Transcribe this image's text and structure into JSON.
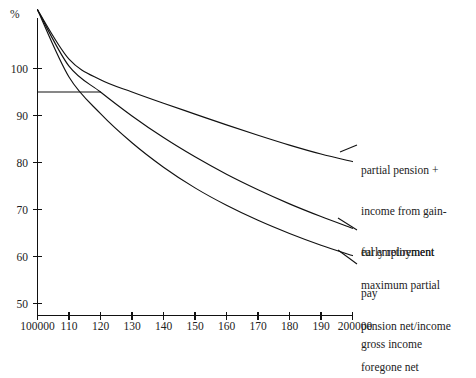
{
  "chart_data": {
    "type": "line",
    "title": "",
    "xlabel": "gross income",
    "ylabel": "%",
    "grid": false,
    "legend_position": "right-inline-annotations",
    "xlim": [
      100000,
      200000
    ],
    "ylim": [
      48,
      113
    ],
    "x_tick_labels": [
      "100000",
      "110",
      "120",
      "130",
      "140",
      "150",
      "160",
      "170",
      "180",
      "190",
      "200000"
    ],
    "x_tick_values": [
      100000,
      110000,
      120000,
      130000,
      140000,
      150000,
      160000,
      170000,
      180000,
      190000,
      200000
    ],
    "y_tick_labels": [
      "100",
      "90",
      "80",
      "70",
      "60",
      "50"
    ],
    "y_tick_values": [
      100,
      90,
      80,
      70,
      60,
      50
    ],
    "x": [
      100000,
      110000,
      120000,
      130000,
      140000,
      150000,
      160000,
      170000,
      180000,
      190000,
      200000
    ],
    "series": [
      {
        "name": "partial pension + income from gainful employment",
        "label_lines": [
          "partial pension +",
          "income from gain-",
          "ful employment"
        ],
        "values": [
          112.5,
          102.0,
          97.6,
          95.0,
          92.6,
          90.3,
          88.0,
          85.8,
          83.7,
          81.8,
          80.2
        ]
      },
      {
        "name": "early retirement pay",
        "label_lines": [
          "early retirement",
          "pay"
        ],
        "values": [
          112.5,
          100.5,
          95.0,
          89.9,
          85.3,
          81.2,
          77.5,
          74.2,
          71.2,
          68.5,
          66.0
        ]
      },
      {
        "name": "maximum partial pension net/income foregone net",
        "label_lines": [
          "maximum partial",
          "pension net/income",
          "foregone net"
        ],
        "values": [
          112.5,
          98.2,
          90.4,
          84.2,
          79.0,
          74.6,
          70.9,
          67.7,
          64.9,
          62.4,
          60.2
        ]
      }
    ],
    "reference_line": {
      "name": "ninety-five-percent-reference",
      "y": 95.0,
      "x_start": 100000,
      "x_end": 120000
    },
    "annotations": [
      {
        "id": "ann-0",
        "lines": [
          "partial pension +",
          "income from gain-",
          "ful employment"
        ]
      },
      {
        "id": "ann-1",
        "lines": [
          "early retirement",
          "pay"
        ]
      },
      {
        "id": "ann-2",
        "lines": [
          "maximum partial",
          "pension net/income",
          "foregone net"
        ]
      }
    ]
  },
  "axes": {
    "y_axis_label": "%",
    "x_axis_label": "gross income"
  },
  "footer": {
    "faint_text": ""
  }
}
